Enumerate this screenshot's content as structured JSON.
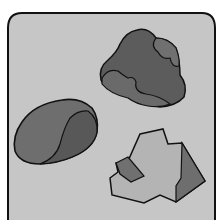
{
  "image": {
    "description": "Illustration of three rocks inside a rounded rectangular frame",
    "colors": {
      "page_background": "#ffffff",
      "frame_fill": "#c6c6c6",
      "outline": "#111111",
      "rock_dark": "#5e5e5e",
      "rock_mid": "#6e6e6e",
      "rock_light": "#b4b4b4",
      "rock_shadow": "#707070"
    },
    "rocks": [
      {
        "name": "dark-blotched-rock",
        "position": "top-right"
      },
      {
        "name": "smooth-pebble-rock",
        "position": "middle-left"
      },
      {
        "name": "faceted-angular-rock",
        "position": "bottom-right"
      }
    ]
  }
}
